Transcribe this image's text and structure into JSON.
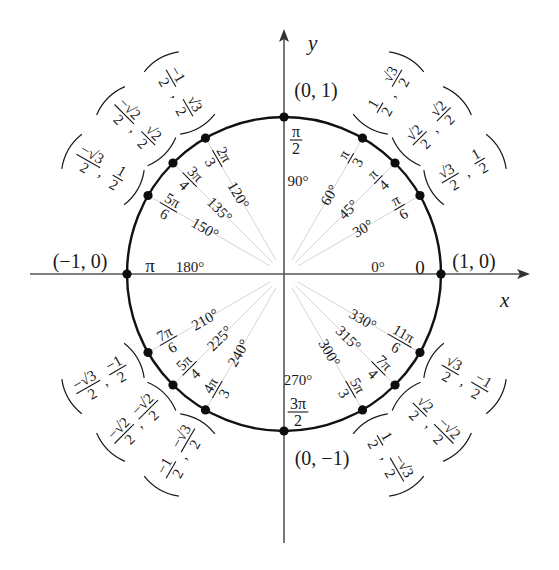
{
  "diagram": {
    "title": "Unit Circle",
    "colors": {
      "background": "#ffffff",
      "circle": "#111111",
      "axis": "#555555",
      "ray": "#cfcfcf",
      "text": "#1a1a1a",
      "point": "#0d0d0d"
    },
    "geometry": {
      "center": [
        284,
        274
      ],
      "radius": 157,
      "x_axis": {
        "from": 30,
        "to": 530
      },
      "y_axis": {
        "from": 543,
        "to": 29
      }
    },
    "axes": {
      "x_label": "x",
      "y_label": "y"
    },
    "axis_points": [
      {
        "deg": 0,
        "rad_num": "0",
        "rad_den": "",
        "deg_label": "0°",
        "coord": "(1, 0)"
      },
      {
        "deg": 90,
        "rad_num": "π",
        "rad_den": "2",
        "deg_label": "90°",
        "coord": "(0, 1)"
      },
      {
        "deg": 180,
        "rad_num": "π",
        "rad_den": "",
        "deg_label": "180°",
        "coord": "(−1, 0)"
      },
      {
        "deg": 270,
        "rad_num": "3π",
        "rad_den": "2",
        "deg_label": "270°",
        "coord": "(0, −1)"
      }
    ],
    "points": [
      {
        "deg": 30,
        "rad_num": "π",
        "rad_den": "6",
        "deg_label": "30°",
        "x_num": "√3",
        "x_den": "2",
        "y_num": "1",
        "y_den": "2"
      },
      {
        "deg": 45,
        "rad_num": "π",
        "rad_den": "4",
        "deg_label": "45°",
        "x_num": "√2",
        "x_den": "2",
        "y_num": "√2",
        "y_den": "2"
      },
      {
        "deg": 60,
        "rad_num": "π",
        "rad_den": "3",
        "deg_label": "60°",
        "x_num": "1",
        "x_den": "2",
        "y_num": "√3",
        "y_den": "2"
      },
      {
        "deg": 120,
        "rad_num": "2π",
        "rad_den": "3",
        "deg_label": "120°",
        "x_num": "−1",
        "x_den": "2",
        "y_num": "√3",
        "y_den": "2"
      },
      {
        "deg": 135,
        "rad_num": "3π",
        "rad_den": "4",
        "deg_label": "135°",
        "x_num": "−√2",
        "x_den": "2",
        "y_num": "√2",
        "y_den": "2"
      },
      {
        "deg": 150,
        "rad_num": "5π",
        "rad_den": "6",
        "deg_label": "150°",
        "x_num": "−√3",
        "x_den": "2",
        "y_num": "1",
        "y_den": "2"
      },
      {
        "deg": 210,
        "rad_num": "7π",
        "rad_den": "6",
        "deg_label": "210°",
        "x_num": "−√3",
        "x_den": "2",
        "y_num": "−1",
        "y_den": "2"
      },
      {
        "deg": 225,
        "rad_num": "5π",
        "rad_den": "4",
        "deg_label": "225°",
        "x_num": "−√2",
        "x_den": "2",
        "y_num": "−√2",
        "y_den": "2"
      },
      {
        "deg": 240,
        "rad_num": "4π",
        "rad_den": "3",
        "deg_label": "240°",
        "x_num": "−1",
        "x_den": "2",
        "y_num": "−√3",
        "y_den": "2"
      },
      {
        "deg": 300,
        "rad_num": "5π",
        "rad_den": "3",
        "deg_label": "300°",
        "x_num": "1",
        "x_den": "2",
        "y_num": "−√3",
        "y_den": "2"
      },
      {
        "deg": 315,
        "rad_num": "7π",
        "rad_den": "4",
        "deg_label": "315°",
        "x_num": "√2",
        "x_den": "2",
        "y_num": "−√2",
        "y_den": "2"
      },
      {
        "deg": 330,
        "rad_num": "11π",
        "rad_den": "6",
        "deg_label": "330°",
        "x_num": "√3",
        "x_den": "2",
        "y_num": "−1",
        "y_den": "2"
      }
    ]
  }
}
